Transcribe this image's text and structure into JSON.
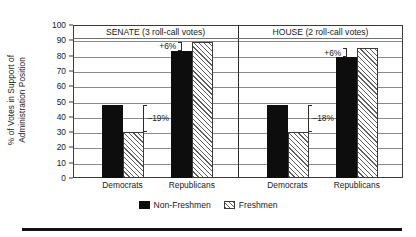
{
  "chart_data": {
    "type": "bar",
    "title": "",
    "xlabel": "",
    "ylabel_line1": "% of Votes in Support of",
    "ylabel_line2": "Administration Position",
    "ylim": [
      0,
      100
    ],
    "ytick_labels": [
      "100",
      "90",
      "80",
      "70",
      "60",
      "50",
      "40",
      "30",
      "20",
      "10",
      "0"
    ],
    "ytick_values": [
      100,
      90,
      80,
      70,
      60,
      50,
      40,
      30,
      20,
      10,
      0
    ],
    "grid": true,
    "legend_position": "bottom-center",
    "legend": [
      "Non-Freshmen",
      "Freshmen"
    ],
    "categories": [
      "Democrats",
      "Republicans"
    ],
    "panels": [
      {
        "title": "SENATE (3 roll-call votes)",
        "categories": [
          "Democrats",
          "Republicans"
        ],
        "series": [
          {
            "name": "Non-Freshmen",
            "values": [
              48,
              83
            ]
          },
          {
            "name": "Freshmen",
            "values": [
              30,
              89
            ]
          }
        ],
        "annotations": [
          {
            "category": "Democrats",
            "label": "–19%",
            "direction": "down"
          },
          {
            "category": "Republicans",
            "label": "+6%",
            "direction": "up"
          }
        ]
      },
      {
        "title": "HOUSE (2 roll-call votes)",
        "categories": [
          "Democrats",
          "Republicans"
        ],
        "series": [
          {
            "name": "Non-Freshmen",
            "values": [
              48,
              79
            ]
          },
          {
            "name": "Freshmen",
            "values": [
              30,
              85
            ]
          }
        ],
        "annotations": [
          {
            "category": "Democrats",
            "label": "–18%",
            "direction": "down"
          },
          {
            "category": "Republicans",
            "label": "+6%",
            "direction": "up"
          }
        ]
      }
    ],
    "colors": {
      "non_freshmen": "#0d0d0d",
      "freshmen_hatch": "#5e5e5e",
      "frame": "#3b3b3b",
      "gridline": "#8a8a8a",
      "background": "#ffffff"
    }
  },
  "axis": {
    "ylabel_line1": "% of Votes in Support of",
    "ylabel_line2": "Administration Position"
  },
  "legend": {
    "items": [
      {
        "label": "Non-Freshmen",
        "style": "solid"
      },
      {
        "label": "Freshmen",
        "style": "hatch"
      }
    ]
  }
}
